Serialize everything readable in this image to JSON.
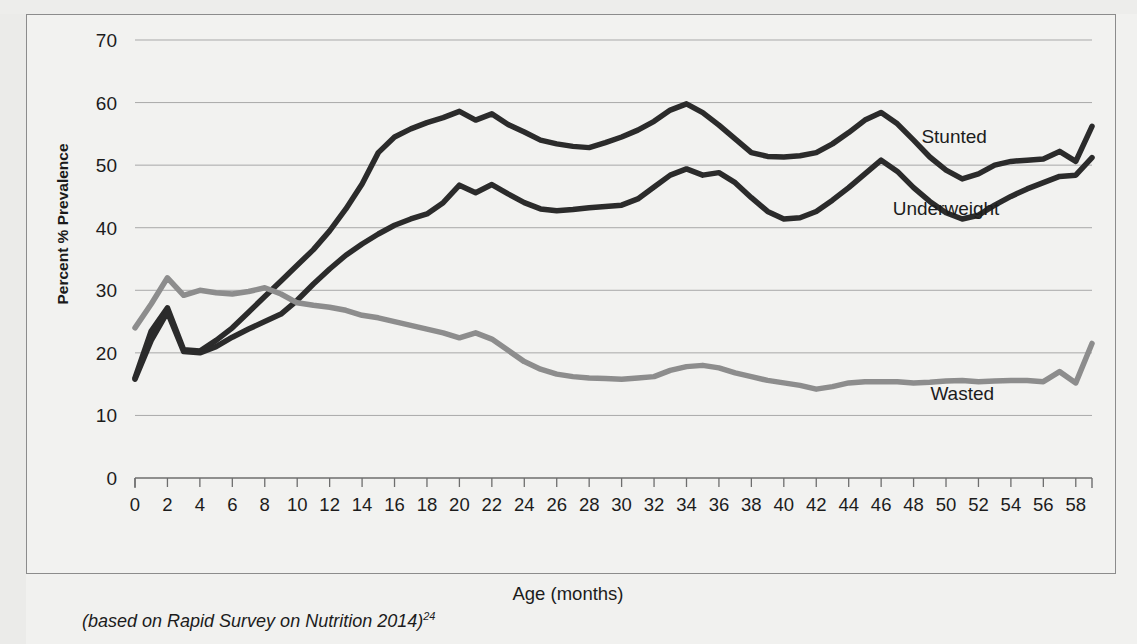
{
  "figure": {
    "caption": "(based on Rapid Survey on Nutrition 2014)",
    "caption_superscript": "24",
    "background_color": "#f1f1ef",
    "frame_color": "#8c8c8c"
  },
  "chart_data": {
    "type": "line",
    "title": "",
    "xlabel": "Age (months)",
    "ylabel": "Percent % Prevalence",
    "xlim": [
      0,
      59
    ],
    "ylim": [
      0,
      70
    ],
    "ytick_step": 10,
    "xtick_step": 2,
    "grid": true,
    "legend_position": "inline-right",
    "yticks": [
      0,
      10,
      20,
      30,
      40,
      50,
      60,
      70
    ],
    "xticks": [
      0,
      2,
      4,
      6,
      8,
      10,
      12,
      14,
      16,
      18,
      20,
      22,
      24,
      26,
      28,
      30,
      32,
      34,
      36,
      38,
      40,
      42,
      44,
      46,
      48,
      50,
      52,
      54,
      56,
      58
    ],
    "x": [
      0,
      1,
      2,
      3,
      4,
      5,
      6,
      7,
      8,
      9,
      10,
      11,
      12,
      13,
      14,
      15,
      16,
      17,
      18,
      19,
      20,
      21,
      22,
      23,
      24,
      25,
      26,
      27,
      28,
      29,
      30,
      31,
      32,
      33,
      34,
      35,
      36,
      37,
      38,
      39,
      40,
      41,
      42,
      43,
      44,
      45,
      46,
      47,
      48,
      49,
      50,
      51,
      52,
      53,
      54,
      55,
      56,
      57,
      58,
      59
    ],
    "series": [
      {
        "name": "Stunted",
        "color": "#2b2b2b",
        "width": 5.5,
        "label_x": 50.5,
        "label_y": 53.5,
        "values": [
          16.0,
          23.5,
          27.2,
          20.5,
          20.3,
          22.0,
          24.0,
          26.5,
          29.0,
          31.5,
          34.0,
          36.5,
          39.5,
          43.0,
          47.0,
          52.0,
          54.5,
          55.8,
          56.8,
          57.6,
          58.6,
          57.2,
          58.2,
          56.5,
          55.3,
          54.0,
          53.4,
          53.0,
          52.8,
          53.6,
          54.5,
          55.6,
          57.0,
          58.8,
          59.8,
          58.4,
          56.4,
          54.2,
          52.0,
          51.4,
          51.3,
          51.5,
          52.0,
          53.4,
          55.2,
          57.2,
          58.4,
          56.6,
          54.0,
          51.3,
          49.2,
          47.8,
          48.6,
          50.0,
          50.6,
          50.8,
          51.0,
          52.2,
          50.6,
          56.2
        ]
      },
      {
        "name": "Underweight",
        "color": "#2b2b2b",
        "width": 5.5,
        "label_x": 50.0,
        "label_y": 42.0,
        "values": [
          15.8,
          22.0,
          26.5,
          20.2,
          20.0,
          21.0,
          22.5,
          23.8,
          25.0,
          26.2,
          28.4,
          31.0,
          33.4,
          35.6,
          37.4,
          39.0,
          40.4,
          41.4,
          42.2,
          44.0,
          46.8,
          45.6,
          46.9,
          45.4,
          44.0,
          43.0,
          42.7,
          42.9,
          43.2,
          43.4,
          43.6,
          44.6,
          46.5,
          48.4,
          49.4,
          48.4,
          48.8,
          47.2,
          44.8,
          42.6,
          41.4,
          41.6,
          42.6,
          44.4,
          46.4,
          48.6,
          50.8,
          49.0,
          46.4,
          44.2,
          42.4,
          41.4,
          42.0,
          43.6,
          45.0,
          46.2,
          47.2,
          48.2,
          48.4,
          51.2
        ]
      },
      {
        "name": "Wasted",
        "color": "#8d8d8d",
        "width": 5.5,
        "label_x": 51.0,
        "label_y": 12.5,
        "values": [
          24.0,
          27.8,
          32.0,
          29.2,
          30.0,
          29.6,
          29.4,
          29.8,
          30.4,
          29.4,
          28.0,
          27.6,
          27.3,
          26.8,
          26.0,
          25.6,
          25.0,
          24.4,
          23.8,
          23.2,
          22.4,
          23.2,
          22.2,
          20.4,
          18.6,
          17.4,
          16.6,
          16.2,
          16.0,
          15.9,
          15.8,
          16.0,
          16.2,
          17.2,
          17.8,
          18.0,
          17.6,
          16.8,
          16.2,
          15.6,
          15.2,
          14.8,
          14.2,
          14.6,
          15.2,
          15.4,
          15.4,
          15.4,
          15.2,
          15.3,
          15.5,
          15.6,
          15.4,
          15.5,
          15.6,
          15.6,
          15.4,
          17.0,
          15.2,
          21.5
        ]
      }
    ]
  }
}
